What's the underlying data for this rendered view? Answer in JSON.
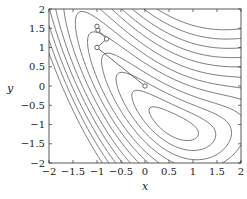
{
  "chart_data": {
    "type": "contour",
    "title": "",
    "xlabel": "x",
    "ylabel": "y",
    "xlim": [
      -2,
      2
    ],
    "ylim": [
      -2,
      2
    ],
    "xticks": [
      "-2",
      "-1.5",
      "-1",
      "-0.5",
      "0",
      "0.5",
      "1",
      "1.5",
      "2"
    ],
    "yticks": [
      "-2",
      "-1.5",
      "-1",
      "-0.5",
      "0",
      "0.5",
      "1",
      "1.5",
      "2"
    ],
    "grid": false,
    "legend": null,
    "contour_levels": [
      0.15,
      0.45,
      0.9,
      1.5,
      2.3,
      3.2,
      4.3,
      5.6,
      7.0,
      8.6,
      10.4,
      12.4
    ],
    "path": {
      "marker": "open-circle",
      "points": [
        {
          "x": 0.0,
          "y": 0.0
        },
        {
          "x": -1.0,
          "y": 1.0
        },
        {
          "x": -0.8,
          "y": 1.22
        },
        {
          "x": -0.98,
          "y": 1.45
        },
        {
          "x": -1.0,
          "y": 1.55
        }
      ]
    },
    "colors": {
      "contour": "#555555",
      "path": "#444444",
      "frame": "#333333"
    }
  }
}
